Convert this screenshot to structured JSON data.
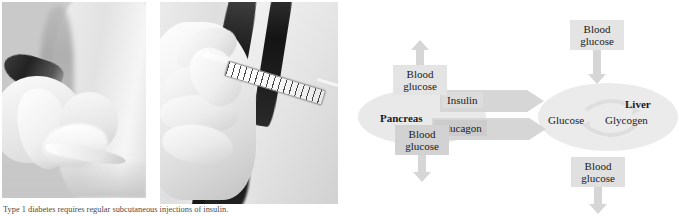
{
  "figure": {
    "caption": "Type 1 diabetes requires regular subcutaneous injections of insulin."
  },
  "photos": [
    {
      "name": "photo-pinching-skin-fold",
      "alt": "Hands pinching a fold of skin before an insulin injection"
    },
    {
      "name": "photo-insulin-injection-arm",
      "alt": "A person self-injecting insulin with a syringe into the upper arm"
    }
  ],
  "diagram": {
    "organs": {
      "pancreas": "Pancreas",
      "liver": "Liver"
    },
    "liver_inner": {
      "glucose": "Glucose",
      "glycogen": "Glycogen"
    },
    "hormones": {
      "insulin": "Insulin",
      "glucagon": "Glucagon"
    },
    "blood_glucose_boxes": {
      "pancreas_top_line1": "Blood",
      "pancreas_top_line2": "glucose",
      "pancreas_bottom_line1": "Blood",
      "pancreas_bottom_line2": "glucose",
      "liver_top_line1": "Blood",
      "liver_top_line2": "glucose",
      "liver_bottom_line1": "Blood",
      "liver_bottom_line2": "glucose"
    },
    "arrow_directions": {
      "pancreas_top": "up",
      "pancreas_bottom": "down",
      "liver_top": "down",
      "liver_bottom": "down",
      "insulin": "right",
      "glucagon": "right"
    },
    "colors": {
      "organ_fill": "#e9e9e9",
      "box_fill_light": "#e4e4e4",
      "box_fill_dark": "#d2d2d2",
      "arrow_fill": "#d6d6d6",
      "text": "#1a1a1a",
      "background": "#ffffff"
    }
  }
}
